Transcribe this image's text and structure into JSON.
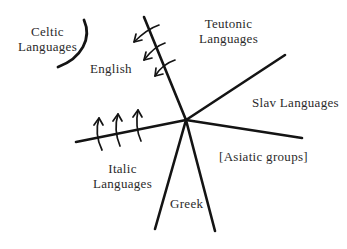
{
  "diagram": {
    "type": "language-family-tree-radial",
    "labels": {
      "celtic": [
        "Celtic",
        "Languages"
      ],
      "english": "English",
      "teutonic": [
        "Teutonic",
        "Languages"
      ],
      "slav": "Slav Languages",
      "italic": [
        "Italic",
        "Languages"
      ],
      "asiatic": "[Asiatic groups]",
      "greek": "Greek"
    },
    "colors": {
      "line": "#141414",
      "text": "#2a2a2a",
      "background": "#ffffff"
    }
  }
}
